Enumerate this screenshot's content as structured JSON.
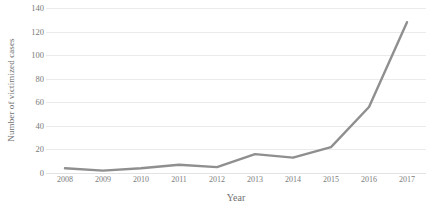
{
  "chart_data": {
    "type": "line",
    "title": "",
    "xlabel": "Year",
    "ylabel": "Number of victimized cases",
    "categories": [
      "2008",
      "2009",
      "2010",
      "2011",
      "2012",
      "2013",
      "2014",
      "2015",
      "2016",
      "2017"
    ],
    "values": [
      4,
      2,
      4,
      7,
      5,
      16,
      13,
      22,
      56,
      128
    ],
    "series": [
      {
        "name": "Number of victimized cases",
        "values": [
          4,
          2,
          4,
          7,
          5,
          16,
          13,
          22,
          56,
          128
        ]
      }
    ],
    "ylim": [
      0,
      140
    ],
    "yticks": [
      0,
      20,
      40,
      60,
      80,
      100,
      120,
      140
    ],
    "ytick_labels": [
      "0",
      "20",
      "40",
      "60",
      "80",
      "100",
      "120",
      "140"
    ],
    "grid": "horizontal",
    "legend": "none",
    "line_color": "#8f8f8f",
    "grid_color": "#ececec",
    "text_color": "#6f6f6f",
    "background": "#ffffff",
    "markers": "none",
    "annotations": []
  }
}
